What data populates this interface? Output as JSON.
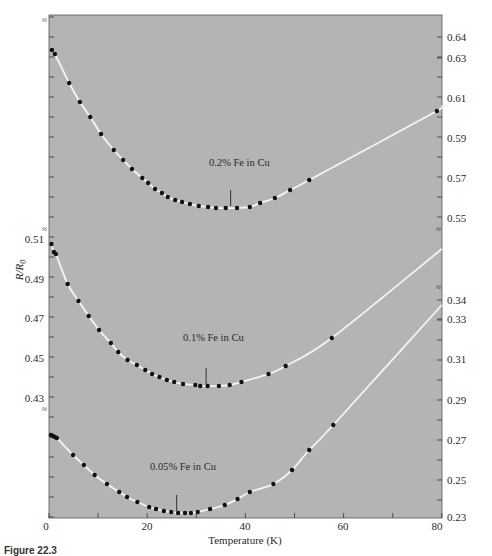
{
  "chart_data": {
    "type": "scatter",
    "title": "",
    "xlabel": "Temperature (K)",
    "ylabel": "R/R0",
    "xlim": [
      0,
      80
    ],
    "x_ticks": [
      0,
      20,
      40,
      60,
      80
    ],
    "grid": false,
    "background": "#b4b4b4",
    "axes": {
      "left": {
        "label": "R/R0",
        "ticks": [
          0.43,
          0.45,
          0.47,
          0.49,
          0.51
        ],
        "applies_to": "0.1% Fe in Cu"
      },
      "right_upper": {
        "ticks": [
          0.55,
          0.57,
          0.59,
          0.61,
          0.63,
          0.64
        ],
        "applies_to": "0.2% Fe in Cu"
      },
      "right_lower": {
        "ticks": [
          0.23,
          0.25,
          0.27,
          0.29,
          0.31,
          0.33,
          0.34
        ],
        "applies_to": "0.05% Fe in Cu"
      }
    },
    "series": [
      {
        "name": "0.2% Fe in Cu",
        "axis": "right_upper",
        "minimum_marker_T": 37,
        "x": [
          0.6,
          1.2,
          4.1,
          6.3,
          8.4,
          10.6,
          13.2,
          15.1,
          16.9,
          19.0,
          20.2,
          21.6,
          23.0,
          24.2,
          25.7,
          27.1,
          28.7,
          30.5,
          32.4,
          34.0,
          36.0,
          38.3,
          40.9,
          43.0,
          46.0,
          49.1,
          53.0,
          79.0
        ],
        "values": [
          0.6335,
          0.6315,
          0.617,
          0.6075,
          0.6,
          0.5915,
          0.5835,
          0.5785,
          0.574,
          0.5695,
          0.567,
          0.564,
          0.562,
          0.56,
          0.5585,
          0.5575,
          0.5565,
          0.5555,
          0.555,
          0.5545,
          0.5545,
          0.5545,
          0.555,
          0.557,
          0.5595,
          0.5635,
          0.5685,
          0.603
        ]
      },
      {
        "name": "0.1% Fe in Cu",
        "axis": "left",
        "minimum_marker_T": 32,
        "x": [
          0.5,
          1.0,
          1.4,
          3.8,
          6.0,
          8.1,
          10.2,
          12.6,
          14.1,
          16.0,
          17.9,
          19.6,
          21.0,
          22.5,
          24.0,
          25.5,
          27.3,
          29.8,
          30.8,
          32.3,
          34.6,
          36.8,
          39.2,
          44.7,
          48.2,
          57.6
        ],
        "values": [
          0.5075,
          0.5035,
          0.5025,
          0.4875,
          0.479,
          0.4715,
          0.4645,
          0.458,
          0.4535,
          0.4495,
          0.447,
          0.4445,
          0.4425,
          0.441,
          0.4395,
          0.4385,
          0.4375,
          0.437,
          0.4365,
          0.4365,
          0.4365,
          0.437,
          0.4385,
          0.4425,
          0.4465,
          0.4605
        ]
      },
      {
        "name": "0.05% Fe in Cu",
        "axis": "right_lower",
        "minimum_marker_T": 26,
        "x": [
          0.4,
          0.8,
          1.2,
          1.6,
          4.9,
          7.1,
          9.3,
          11.8,
          14.3,
          15.9,
          18.0,
          20.4,
          21.8,
          23.4,
          24.9,
          26.3,
          27.7,
          28.9,
          30.3,
          32.8,
          35.8,
          38.4,
          40.9,
          45.7,
          49.5,
          53.0,
          57.9
        ],
        "values": [
          0.2725,
          0.272,
          0.2715,
          0.271,
          0.2625,
          0.2575,
          0.2525,
          0.248,
          0.244,
          0.2415,
          0.239,
          0.2365,
          0.2355,
          0.2345,
          0.234,
          0.2335,
          0.2335,
          0.2335,
          0.234,
          0.2355,
          0.2375,
          0.2405,
          0.244,
          0.248,
          0.255,
          0.265,
          0.2775
        ]
      }
    ],
    "annotations": [
      "0.2% Fe in Cu",
      "0.1% Fe in Cu",
      "0.05% Fe in Cu"
    ],
    "legend_position": "inline labels"
  },
  "figure": {
    "x_axis_title": "Temperature (K)",
    "y_axis_title_main": "R/R",
    "y_axis_title_sub": "0",
    "caption": "Figure 22.3"
  },
  "ticks": {
    "x": [
      "0",
      "20",
      "40",
      "60",
      "80"
    ],
    "left": [
      "0.51",
      "0.49",
      "0.47",
      "0.45",
      "0.43"
    ],
    "right_upper": [
      "0.64",
      "0.63",
      "0.61",
      "0.59",
      "0.57",
      "0.55"
    ],
    "right_lower": [
      "0.34",
      "0.33",
      "0.31",
      "0.29",
      "0.27",
      "0.25",
      "0.23"
    ]
  },
  "labels": {
    "curve_02": "0.2% Fe in Cu",
    "curve_01": "0.1% Fe in Cu",
    "curve_005": "0.05% Fe in Cu"
  }
}
